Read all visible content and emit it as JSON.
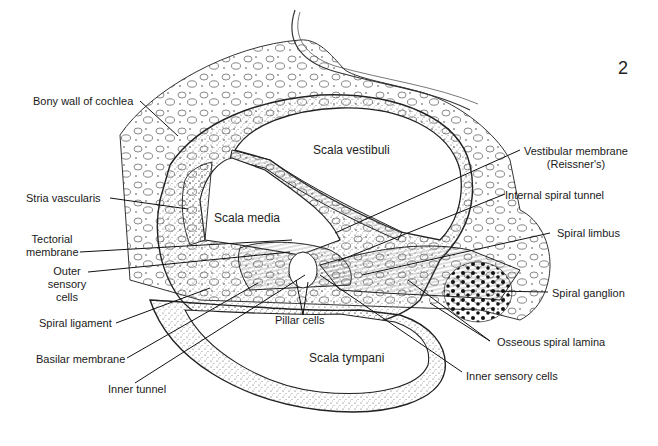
{
  "figure": {
    "number": "2",
    "regions": {
      "scala_vestibuli": "Scala vestibuli",
      "scala_media": "Scala media",
      "scala_tympani": "Scala tympani"
    },
    "labels_left": [
      {
        "id": "bony-wall",
        "text": "Bony wall of cochlea"
      },
      {
        "id": "stria-vascularis",
        "text": "Stria vascularis"
      },
      {
        "id": "tectorial-membrane",
        "line1": "Tectorial",
        "line2": "membrane"
      },
      {
        "id": "outer-sensory-cells",
        "line1": "Outer",
        "line2": "sensory",
        "line3": "cells"
      },
      {
        "id": "spiral-ligament",
        "text": "Spiral ligament"
      },
      {
        "id": "basilar-membrane",
        "text": "Basilar membrane"
      },
      {
        "id": "inner-tunnel",
        "text": "Inner tunnel"
      }
    ],
    "labels_right": [
      {
        "id": "vestibular-membrane",
        "line1": "Vestibular membrane",
        "line2": "(Reissner's)"
      },
      {
        "id": "internal-spiral-tunnel",
        "text": "Internal spiral tunnel"
      },
      {
        "id": "spiral-limbus",
        "text": "Spiral limbus"
      },
      {
        "id": "spiral-ganglion",
        "text": "Spiral ganglion"
      },
      {
        "id": "osseous-spiral-lamina",
        "text": "Osseous spiral lamina"
      },
      {
        "id": "inner-sensory-cells",
        "text": "Inner sensory cells"
      }
    ],
    "labels_center": [
      {
        "id": "pillar-cells",
        "text": "Pillar cells"
      }
    ]
  }
}
